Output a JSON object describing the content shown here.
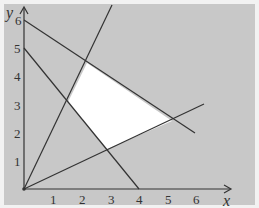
{
  "diagram": {
    "type": "linear-inequality-feasible-region",
    "background_color": "#c8c8c8",
    "feasible_region_color": "#ffffff",
    "line_color": "#333333",
    "axes": {
      "x_label": "x",
      "y_label": "y",
      "x_ticks": [
        "1",
        "2",
        "3",
        "4",
        "5",
        "6"
      ],
      "y_ticks": [
        "1",
        "2",
        "3",
        "4",
        "5",
        "6"
      ]
    },
    "lines": [
      {
        "name": "line-through-0-6-and-6-2",
        "from": [
          0,
          6
        ],
        "to": [
          6,
          2
        ]
      },
      {
        "name": "line-through-0-5-and-4-0",
        "from": [
          0,
          5
        ],
        "to": [
          4,
          0
        ]
      },
      {
        "name": "line-y-equals-2x",
        "from": [
          0,
          0
        ],
        "to": [
          3.1,
          6.5
        ]
      },
      {
        "name": "line-y-equals-half-x",
        "from": [
          0,
          0
        ],
        "to": [
          6.2,
          3.0
        ]
      }
    ],
    "feasible_region_vertices": [
      [
        2.2,
        4.5
      ],
      [
        1.5,
        3.1
      ],
      [
        2.9,
        1.4
      ],
      [
        5.1,
        2.4
      ]
    ]
  }
}
